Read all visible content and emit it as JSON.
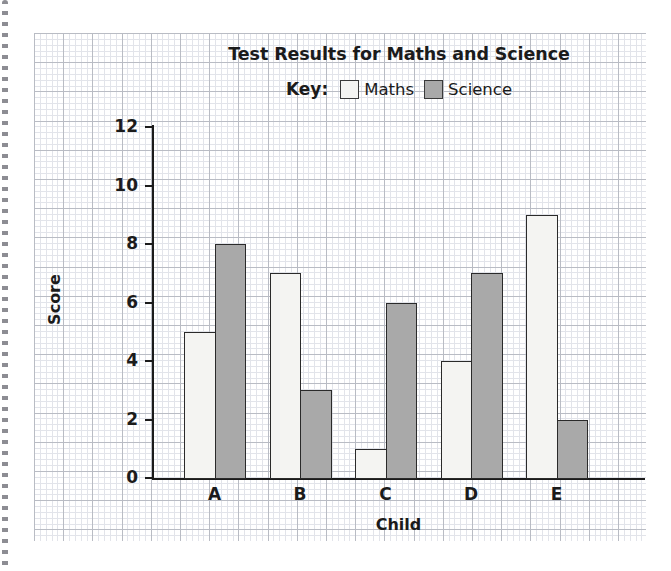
{
  "chart_data": {
    "type": "bar",
    "title": "Test Results for Maths and Science",
    "xlabel": "Child",
    "ylabel": "Score",
    "categories": [
      "A",
      "B",
      "C",
      "D",
      "E"
    ],
    "series": [
      {
        "name": "Maths",
        "values": [
          5,
          7,
          1,
          4,
          9
        ],
        "color": "#f4f4f2"
      },
      {
        "name": "Science",
        "values": [
          8,
          3,
          6,
          7,
          2
        ],
        "color": "#a9a9a9"
      }
    ],
    "ylim": [
      0,
      12
    ],
    "yticks": [
      0,
      2,
      4,
      6,
      8,
      10,
      12
    ],
    "ytick_labels": [
      "0",
      "2",
      "4",
      "6",
      "8",
      "10",
      "12"
    ],
    "grid": true,
    "grid_style": "graph-paper",
    "legend_position": "top-center",
    "legend_prefix": "Key:"
  },
  "legend": {
    "key_label": "Key:",
    "items": [
      {
        "label": "Maths",
        "swatch_color": "#f4f4f2"
      },
      {
        "label": "Science",
        "swatch_color": "#a9a9a9"
      }
    ]
  },
  "axes": {
    "y_title": "Score",
    "x_title": "Child",
    "y_tick_labels": [
      "12",
      "10",
      "8",
      "6",
      "4",
      "2",
      "0"
    ],
    "x_tick_labels": [
      "A",
      "B",
      "C",
      "D",
      "E"
    ]
  },
  "colors": {
    "ink": "#1b1b1b",
    "bar_outline": "#2a2a2a",
    "maths_fill": "#f4f4f2",
    "science_fill": "#a9a9a9",
    "grid_minor": "#e2e4ea",
    "grid_major": "#b9bcc4",
    "paper": "#ffffff"
  }
}
